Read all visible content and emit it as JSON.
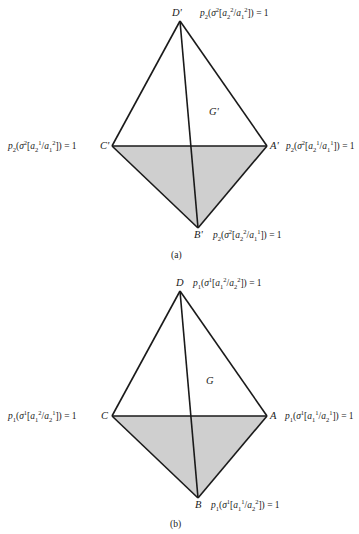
{
  "figures": [
    {
      "id": "a",
      "caption": "(a)",
      "region_label": "G'",
      "vertices": {
        "D": {
          "label": "D'",
          "x": 180,
          "y": 21
        },
        "C": {
          "label": "C'",
          "x": 112,
          "y": 146
        },
        "A": {
          "label": "A'",
          "x": 267,
          "y": 146
        },
        "B": {
          "label": "B'",
          "x": 198,
          "y": 228
        }
      },
      "equations": {
        "D": {
          "p": "p",
          "p_sub": "2",
          "sigma_sup": "2",
          "num": "a",
          "num_sub": "2",
          "num_sup": "2",
          "den": "a",
          "den_sub": "1",
          "den_sup": "2",
          "rhs": "= 1"
        },
        "C": {
          "p": "p",
          "p_sub": "2",
          "sigma_sup": "2",
          "num": "a",
          "num_sub": "2",
          "num_sup": "1",
          "den": "a",
          "den_sub": "1",
          "den_sup": "2",
          "rhs": "= 1"
        },
        "A": {
          "p": "p",
          "p_sub": "2",
          "sigma_sup": "2",
          "num": "a",
          "num_sub": "2",
          "num_sup": "1",
          "den": "a",
          "den_sub": "1",
          "den_sup": "1",
          "rhs": "= 1"
        },
        "B": {
          "p": "p",
          "p_sub": "2",
          "sigma_sup": "2",
          "num": "a",
          "num_sub": "2",
          "num_sup": "2",
          "den": "a",
          "den_sub": "1",
          "den_sup": "1",
          "rhs": "= 1"
        }
      }
    },
    {
      "id": "b",
      "caption": "(b)",
      "region_label": "G",
      "vertices": {
        "D": {
          "label": "D",
          "x": 180,
          "y": 291
        },
        "C": {
          "label": "C",
          "x": 112,
          "y": 416
        },
        "A": {
          "label": "A",
          "x": 267,
          "y": 416
        },
        "B": {
          "label": "B",
          "x": 198,
          "y": 498
        }
      },
      "equations": {
        "D": {
          "p": "p",
          "p_sub": "1",
          "sigma_sup": "1",
          "num": "a",
          "num_sub": "1",
          "num_sup": "2",
          "den": "a",
          "den_sub": "2",
          "den_sup": "2",
          "rhs": "= 1"
        },
        "C": {
          "p": "p",
          "p_sub": "1",
          "sigma_sup": "1",
          "num": "a",
          "num_sub": "1",
          "num_sup": "2",
          "den": "a",
          "den_sub": "2",
          "den_sup": "1",
          "rhs": "= 1"
        },
        "A": {
          "p": "p",
          "p_sub": "1",
          "sigma_sup": "1",
          "num": "a",
          "num_sub": "1",
          "num_sup": "1",
          "den": "a",
          "den_sub": "2",
          "den_sup": "1",
          "rhs": "= 1"
        },
        "B": {
          "p": "p",
          "p_sub": "1",
          "sigma_sup": "1",
          "num": "a",
          "num_sub": "1",
          "num_sup": "1",
          "den": "a",
          "den_sub": "2",
          "den_sup": "2",
          "rhs": "= 1"
        }
      }
    }
  ],
  "colors": {
    "stroke": "#1a1a1a",
    "shade": "#cfcfcf",
    "background": "#ffffff"
  }
}
